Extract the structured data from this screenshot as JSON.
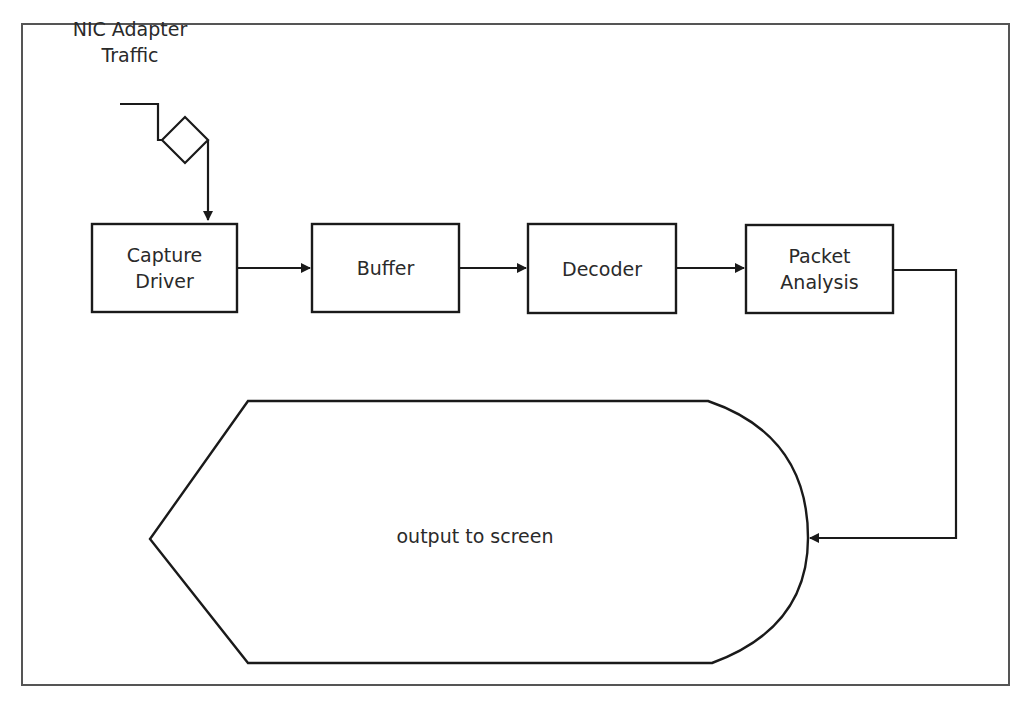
{
  "diagram": {
    "type": "flowchart",
    "input": {
      "label": "NIC Adapter\nTraffic"
    },
    "nodes": [
      {
        "id": "capture_driver",
        "label": "Capture\nDriver"
      },
      {
        "id": "buffer",
        "label": "Buffer"
      },
      {
        "id": "decoder",
        "label": "Decoder"
      },
      {
        "id": "packet_analysis",
        "label": "Packet\nAnalysis"
      }
    ],
    "output": {
      "id": "display",
      "label": "output to screen"
    },
    "edges": [
      {
        "from": "input",
        "to": "capture_driver"
      },
      {
        "from": "capture_driver",
        "to": "buffer"
      },
      {
        "from": "buffer",
        "to": "decoder"
      },
      {
        "from": "decoder",
        "to": "packet_analysis"
      },
      {
        "from": "packet_analysis",
        "to": "display"
      }
    ]
  },
  "colors": {
    "line": "#1a1a1a",
    "frame": "#555555",
    "background": "#ffffff"
  }
}
